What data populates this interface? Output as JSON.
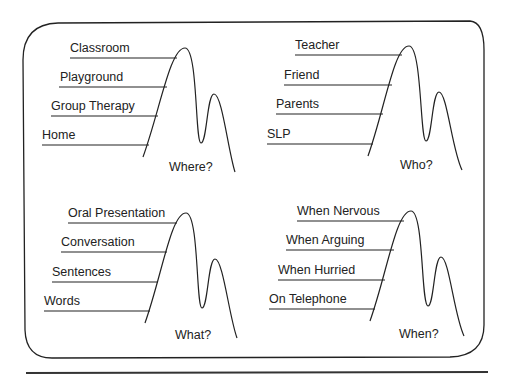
{
  "panels": [
    {
      "question": "Where?",
      "items": [
        "Classroom",
        "Playground",
        "Group Therapy",
        "Home"
      ]
    },
    {
      "question": "Who?",
      "items": [
        "Teacher",
        "Friend",
        "Parents",
        "SLP"
      ]
    },
    {
      "question": "What?",
      "items": [
        "Oral Presentation",
        "Conversation",
        "Sentences",
        "Words"
      ]
    },
    {
      "question": "When?",
      "items": [
        "When Nervous",
        "When Arguing",
        "When Hurried",
        "On Telephone"
      ]
    }
  ],
  "colors": {
    "ink": "#222222",
    "background": "#ffffff"
  }
}
